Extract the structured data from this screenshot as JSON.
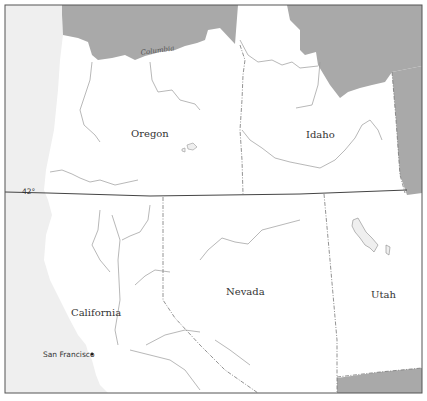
{
  "map": {
    "colors": {
      "ocean": "#efefef",
      "land": "#ffffff",
      "neighbor": "#a9a9a9",
      "frame": "#555555",
      "parallel": "#444444"
    },
    "parallel": {
      "label": "42°"
    },
    "states": [
      {
        "name": "Oregon"
      },
      {
        "name": "Idaho"
      },
      {
        "name": "California"
      },
      {
        "name": "Nevada"
      },
      {
        "name": "Utah"
      }
    ],
    "rivers": [
      {
        "name": "Columbia"
      }
    ],
    "cities": [
      {
        "name": "San Francisco"
      }
    ]
  }
}
